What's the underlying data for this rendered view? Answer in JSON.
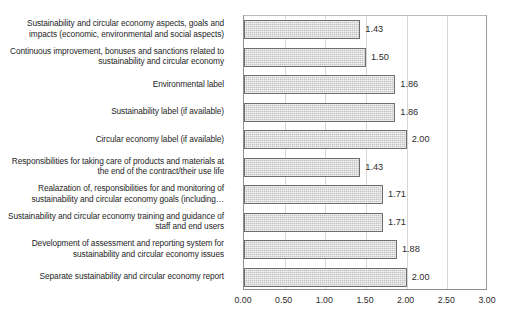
{
  "chart_data": {
    "type": "bar",
    "orientation": "horizontal",
    "title": "",
    "xlabel": "",
    "ylabel": "",
    "xlim": [
      0,
      3
    ],
    "xticks": [
      "0.00",
      "0.50",
      "1.00",
      "1.50",
      "2.00",
      "2.50",
      "3.00"
    ],
    "grid": true,
    "legend": false,
    "categories": [
      "Sustainability and circular economy aspects, goals and impacts (economic, environmental and social aspects)",
      "Continuous improvement, bonuses and sanctions related to sustainability and circular economy",
      "Environmental label",
      "Sustainability label (if available)",
      "Circular economy label (if available)",
      "Responsibilities for taking care of products and materials at the end of the contract/their use life",
      "Realazation of, responsibilities for and monitoring of sustainability and circular economy goals (including…",
      "Sustainability and circular economy training and guidance of staff and end users",
      "Development of assessment and reporting system for sustainability and circular economy issues",
      "Separate sustainability and circular economy report"
    ],
    "values": [
      1.43,
      1.5,
      1.86,
      1.86,
      2.0,
      1.43,
      1.71,
      1.71,
      1.88,
      2.0
    ],
    "value_labels": [
      "1.43",
      "1.50",
      "1.86",
      "1.86",
      "2.00",
      "1.43",
      "1.71",
      "1.71",
      "1.88",
      "2.00"
    ],
    "colors": {
      "bar_fill": "#c3c3c3",
      "bar_border": "#6e6e6e",
      "gridline": "#d8d8d8",
      "axis": "#8e8e8e",
      "text": "#2b2b2b",
      "background": "#ffffff"
    }
  }
}
